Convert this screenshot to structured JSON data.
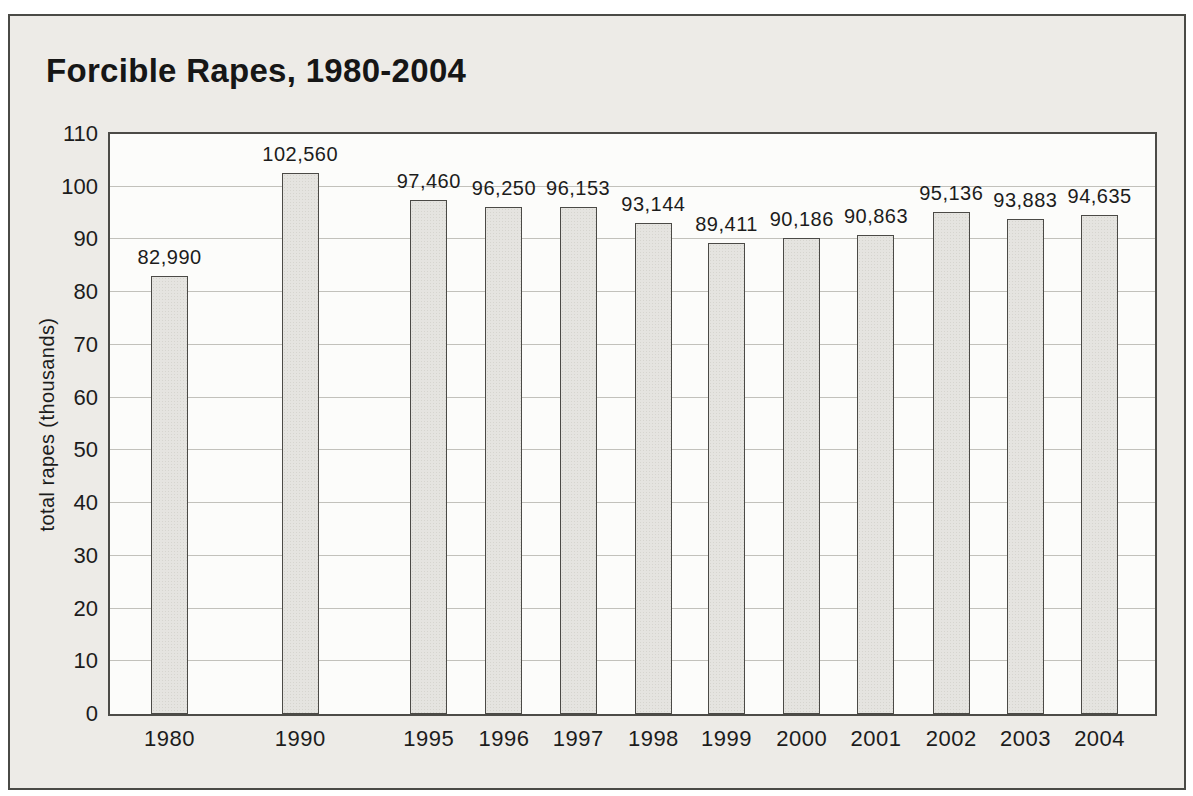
{
  "figure": {
    "title": "Forcible Rapes, 1980-2004",
    "y_axis_title": "total rapes (thousands)"
  },
  "chart_data": {
    "type": "bar",
    "title": "Forcible Rapes, 1980-2004",
    "categories": [
      "1980",
      "1990",
      "1995",
      "1996",
      "1997",
      "1998",
      "1999",
      "2000",
      "2001",
      "2002",
      "2003",
      "2004"
    ],
    "values": [
      82990,
      102560,
      97460,
      96250,
      96153,
      93144,
      89411,
      90186,
      90863,
      95136,
      93883,
      94635
    ],
    "value_labels": [
      "82,990",
      "102,560",
      "97,460",
      "96,250",
      "96,153",
      "93,144",
      "89,411",
      "90,186",
      "90,863",
      "95,136",
      "93,883",
      "94,635"
    ],
    "xlabel": "",
    "ylabel": "total rapes (thousands)",
    "ylim": [
      0,
      110
    ],
    "yticks": [
      0,
      10,
      20,
      30,
      40,
      50,
      60,
      70,
      80,
      90,
      100,
      110
    ],
    "y_units": "thousands",
    "grid": "horizontal",
    "legend": "none",
    "colors": {
      "bar_fill": "#e5e4e0",
      "bar_border": "#4b4a46",
      "frame_border": "#4a4a46",
      "figure_background": "#edebe7",
      "plot_background": "#fcfcfa",
      "gridline": "#c2c1bb",
      "text": "#1c1c1c"
    }
  }
}
